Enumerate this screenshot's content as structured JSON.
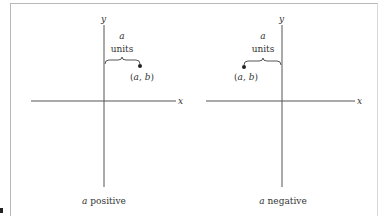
{
  "figure": {
    "panels": [
      {
        "id": "left",
        "caption_var": "a",
        "caption_text": "positive",
        "axis_x_label": "x",
        "axis_y_label": "y",
        "bracket_label_top": "a",
        "bracket_label_bottom": "units",
        "point_label": "(a, b)",
        "point_open": "(",
        "point_a": "a",
        "point_comma": ", ",
        "point_b": "b",
        "point_close": ")"
      },
      {
        "id": "right",
        "caption_var": "a",
        "caption_text": "negative",
        "axis_x_label": "x",
        "axis_y_label": "y",
        "bracket_label_top": "a",
        "bracket_label_bottom": "units",
        "point_label": "(a, b)",
        "point_open": "(",
        "point_a": "a",
        "point_comma": ", ",
        "point_b": "b",
        "point_close": ")"
      }
    ],
    "colors": {
      "axis": "#555555",
      "text": "#333333",
      "point": "#222222",
      "frame": "#b8b8b8"
    }
  }
}
